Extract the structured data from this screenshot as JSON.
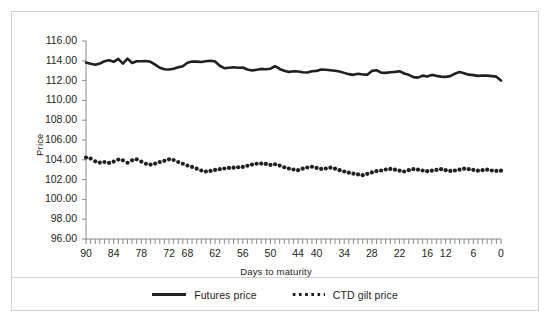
{
  "figure": {
    "border_color": "#d4d2d1",
    "background": "#ffffff",
    "ink_color": "#231f20"
  },
  "chart_data": {
    "type": "line",
    "title": "",
    "subtitle": "",
    "xlabel": "Days to maturity",
    "ylabel": "Price",
    "grid": false,
    "legend_position": "bottom-center",
    "xlim": [
      90,
      0
    ],
    "x_inverted": true,
    "ylim": [
      96.0,
      116.0
    ],
    "ytick_labels": [
      "116.00",
      "114.00",
      "112.00",
      "110.00",
      "108.00",
      "106.00",
      "104.00",
      "102.00",
      "100.00",
      "98.00",
      "96.00"
    ],
    "yticks": [
      116.0,
      114.0,
      112.0,
      110.0,
      108.0,
      106.0,
      104.0,
      102.0,
      100.0,
      98.0,
      96.0
    ],
    "xtick_labels": [
      "90",
      "84",
      "78",
      "72",
      "68",
      "62",
      "56",
      "50",
      "44",
      "40",
      "34",
      "28",
      "22",
      "16",
      "12",
      "6",
      "0"
    ],
    "xticks": [
      90,
      84,
      78,
      72,
      68,
      62,
      56,
      50,
      44,
      40,
      34,
      28,
      22,
      16,
      12,
      6,
      0
    ],
    "x_minor_tick_step": 1,
    "x": [
      90,
      89,
      88,
      87,
      86,
      85,
      84,
      83,
      82,
      81,
      80,
      79,
      78,
      77,
      76,
      75,
      74,
      73,
      72,
      71,
      70,
      69,
      68,
      67,
      66,
      65,
      64,
      63,
      62,
      61,
      60,
      59,
      58,
      57,
      56,
      55,
      54,
      53,
      52,
      51,
      50,
      49,
      48,
      47,
      46,
      45,
      44,
      43,
      42,
      41,
      40,
      39,
      38,
      37,
      36,
      35,
      34,
      33,
      32,
      31,
      30,
      29,
      28,
      27,
      26,
      25,
      24,
      23,
      22,
      21,
      20,
      19,
      18,
      17,
      16,
      15,
      14,
      13,
      12,
      11,
      10,
      9,
      8,
      7,
      6,
      5,
      4,
      3,
      2,
      1,
      0
    ],
    "series": [
      {
        "name": "Futures price",
        "style": "solid",
        "color": "#231f20",
        "width": 2.6,
        "values": [
          113.82,
          113.7,
          113.6,
          113.72,
          113.95,
          114.05,
          113.9,
          114.2,
          113.72,
          114.22,
          113.78,
          113.95,
          113.95,
          113.98,
          113.9,
          113.62,
          113.3,
          113.15,
          113.12,
          113.2,
          113.35,
          113.45,
          113.8,
          113.92,
          113.92,
          113.88,
          113.95,
          114.0,
          113.92,
          113.5,
          113.25,
          113.3,
          113.35,
          113.3,
          113.32,
          113.12,
          113.02,
          113.1,
          113.18,
          113.15,
          113.2,
          113.45,
          113.18,
          113.0,
          112.88,
          112.95,
          112.92,
          112.85,
          112.82,
          112.95,
          112.98,
          113.12,
          113.1,
          113.05,
          113.0,
          112.92,
          112.78,
          112.65,
          112.58,
          112.7,
          112.62,
          112.6,
          112.98,
          113.05,
          112.8,
          112.78,
          112.85,
          112.88,
          112.95,
          112.72,
          112.58,
          112.35,
          112.3,
          112.5,
          112.42,
          112.58,
          112.48,
          112.4,
          112.38,
          112.45,
          112.7,
          112.88,
          112.75,
          112.6,
          112.55,
          112.48,
          112.52,
          112.5,
          112.45,
          112.4,
          112.0
        ]
      },
      {
        "name": "CTD gilt price",
        "style": "dotted",
        "color": "#231f20",
        "marker_size": 2.1,
        "values": [
          104.22,
          104.12,
          103.85,
          103.72,
          103.78,
          103.68,
          103.82,
          104.02,
          103.95,
          103.7,
          103.95,
          104.05,
          103.82,
          103.6,
          103.52,
          103.62,
          103.78,
          103.9,
          104.05,
          103.98,
          103.78,
          103.6,
          103.42,
          103.28,
          103.1,
          102.92,
          102.82,
          102.88,
          102.98,
          103.05,
          103.12,
          103.18,
          103.2,
          103.25,
          103.28,
          103.4,
          103.52,
          103.6,
          103.62,
          103.58,
          103.48,
          103.55,
          103.42,
          103.25,
          103.12,
          103.02,
          102.95,
          103.1,
          103.22,
          103.3,
          103.18,
          103.08,
          103.12,
          103.2,
          103.1,
          102.95,
          102.82,
          102.7,
          102.6,
          102.52,
          102.45,
          102.58,
          102.72,
          102.85,
          102.92,
          103.02,
          103.08,
          103.0,
          102.9,
          102.82,
          102.95,
          103.05,
          103.0,
          102.92,
          102.85,
          102.9,
          102.98,
          103.05,
          102.95,
          102.88,
          102.92,
          103.0,
          103.1,
          103.05,
          102.98,
          102.9,
          102.95,
          103.0,
          102.92,
          102.88,
          102.9
        ]
      }
    ]
  }
}
